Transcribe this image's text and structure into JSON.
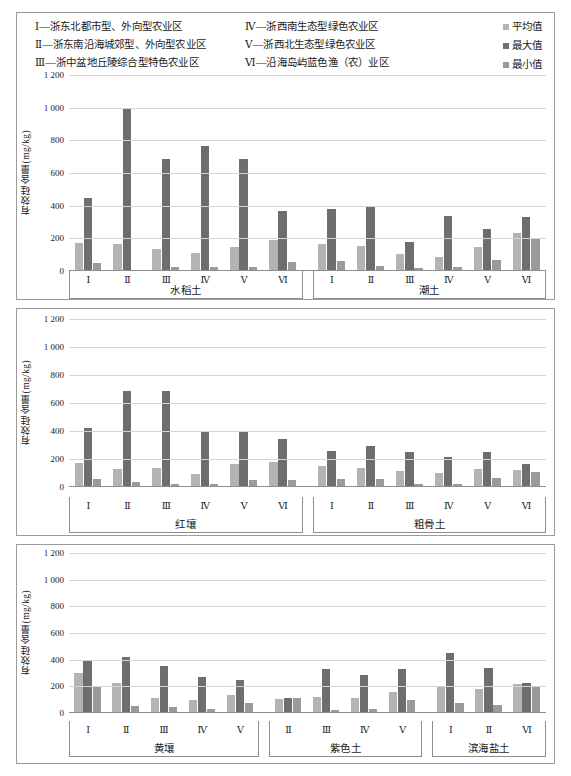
{
  "legend": {
    "categories_col1": [
      "Ⅰ—浙东北都市型、外向型农业区",
      "Ⅱ—浙东南沿海城郊型、外向型农业区",
      "Ⅲ—浙中盆地丘陵综合型特色农业区"
    ],
    "categories_col2": [
      "Ⅳ—浙西南生态型绿色农业区",
      "Ⅴ—浙西北生态型绿色农业区",
      "Ⅵ—沿海岛屿蓝色渔（农）业区"
    ],
    "series": [
      {
        "name": "平均值",
        "color": "#b3b3b3"
      },
      {
        "name": "最大值",
        "color": "#6e6e6e"
      },
      {
        "name": "最小值",
        "color": "#9a9a9a"
      }
    ]
  },
  "chart_data": [
    {
      "type": "bar",
      "panel": 1,
      "ylabel": "有效硅含量(mg/kg)",
      "ylim": [
        0,
        1200
      ],
      "yticks": [
        0,
        200,
        400,
        600,
        800,
        1000,
        1200
      ],
      "ytick_labels": [
        "0",
        "200",
        "400",
        "600",
        "800",
        "1 000",
        "1 200"
      ],
      "grid": true,
      "legend_position": "top-right",
      "series_names": [
        "平均值",
        "最大值",
        "最小值"
      ],
      "groups": [
        {
          "soil": "水稻土",
          "categories": [
            "Ⅰ",
            "Ⅱ",
            "Ⅲ",
            "Ⅳ",
            "Ⅴ",
            "Ⅵ"
          ],
          "series": [
            {
              "name": "平均值",
              "values": [
                170,
                163,
                137,
                108,
                145,
                192
              ]
            },
            {
              "name": "最大值",
              "values": [
                447,
                1000,
                685,
                765,
                686,
                370
              ]
            },
            {
              "name": "最小值",
              "values": [
                50,
                4,
                23,
                23,
                24,
                58
              ]
            }
          ]
        },
        {
          "soil": "潮土",
          "categories": [
            "Ⅰ",
            "Ⅱ",
            "Ⅲ",
            "Ⅳ",
            "Ⅴ",
            "Ⅵ"
          ],
          "series": [
            {
              "name": "平均值",
              "values": [
                163,
                152,
                104,
                87,
                148,
                230
              ]
            },
            {
              "name": "最大值",
              "values": [
                382,
                400,
                180,
                335,
                255,
                330
              ]
            },
            {
              "name": "最小值",
              "values": [
                60,
                32,
                16,
                25,
                68,
                198
              ]
            }
          ]
        }
      ]
    },
    {
      "type": "bar",
      "panel": 2,
      "ylabel": "有效硅含量(mg/kg)",
      "ylim": [
        0,
        1200
      ],
      "yticks": [
        0,
        200,
        400,
        600,
        800,
        1000,
        1200
      ],
      "ytick_labels": [
        "0",
        "200",
        "400",
        "600",
        "800",
        "1 000",
        "1 200"
      ],
      "grid": true,
      "series_names": [
        "平均值",
        "最大值",
        "最小值"
      ],
      "groups": [
        {
          "soil": "红壤",
          "categories": [
            "Ⅰ",
            "Ⅱ",
            "Ⅲ",
            "Ⅳ",
            "Ⅴ",
            "Ⅵ"
          ],
          "series": [
            {
              "name": "平均值",
              "values": [
                172,
                131,
                134,
                96,
                166,
                178
              ]
            },
            {
              "name": "最大值",
              "values": [
                418,
                686,
                686,
                400,
                400,
                345
              ]
            },
            {
              "name": "最小值",
              "values": [
                57,
                33,
                25,
                24,
                51,
                48
              ]
            }
          ]
        },
        {
          "soil": "粗骨土",
          "categories": [
            "Ⅰ",
            "Ⅱ",
            "Ⅲ",
            "Ⅳ",
            "Ⅴ",
            "Ⅵ"
          ],
          "series": [
            {
              "name": "平均值",
              "values": [
                148,
                135,
                113,
                100,
                130,
                120
              ]
            },
            {
              "name": "最大值",
              "values": [
                258,
                290,
                250,
                215,
                248,
                163
              ]
            },
            {
              "name": "最小值",
              "values": [
                60,
                57,
                25,
                22,
                63,
                105
              ]
            }
          ]
        }
      ]
    },
    {
      "type": "bar",
      "panel": 3,
      "ylabel": "有效硅含量(mg/kg)",
      "ylim": [
        0,
        1200
      ],
      "yticks": [
        0,
        200,
        400,
        600,
        800,
        1000,
        1200
      ],
      "ytick_labels": [
        "0",
        "200",
        "400",
        "600",
        "800",
        "1 000",
        "1 200"
      ],
      "grid": true,
      "series_names": [
        "平均值",
        "最大值",
        "最小值"
      ],
      "groups": [
        {
          "soil": "黄壤",
          "categories": [
            "Ⅰ",
            "Ⅱ",
            "Ⅲ",
            "Ⅳ",
            "Ⅴ"
          ],
          "series": [
            {
              "name": "平均值",
              "values": [
                298,
                222,
                112,
                97,
                132
              ]
            },
            {
              "name": "最大值",
              "values": [
                400,
                422,
                352,
                272,
                246
              ]
            },
            {
              "name": "最小值",
              "values": [
                196,
                52,
                45,
                30,
                75
              ]
            }
          ]
        },
        {
          "soil": "紫色土",
          "categories": [
            "Ⅱ",
            "Ⅲ",
            "Ⅳ",
            "Ⅴ"
          ],
          "series": [
            {
              "name": "平均值",
              "values": [
                108,
                120,
                110,
                158
              ]
            },
            {
              "name": "最大值",
              "values": [
                110,
                330,
                288,
                330
              ]
            },
            {
              "name": "最小值",
              "values": [
                110,
                22,
                28,
                100
              ]
            }
          ]
        },
        {
          "soil": "滨海盐土",
          "categories": [
            "Ⅰ",
            "Ⅱ",
            "Ⅵ"
          ],
          "series": [
            {
              "name": "平均值",
              "values": [
                205,
                180,
                215
              ]
            },
            {
              "name": "最大值",
              "values": [
                450,
                335,
                222
              ]
            },
            {
              "name": "最小值",
              "values": [
                75,
                62,
                200
              ]
            }
          ]
        }
      ]
    }
  ]
}
